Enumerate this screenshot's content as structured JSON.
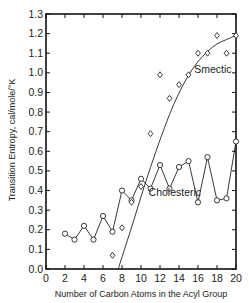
{
  "chart_data": {
    "type": "line",
    "title": "",
    "xlabel": "Number of Carbon Atoms in the Acyl Group",
    "ylabel": "Transition Entropy, cal/mole/°K",
    "xlim": [
      0,
      20
    ],
    "ylim": [
      0,
      1.3
    ],
    "x_ticks": [
      0,
      2,
      4,
      6,
      8,
      10,
      12,
      14,
      16,
      18,
      20
    ],
    "y_ticks": [
      "0.0",
      "0.1",
      "0.2",
      "0.3",
      "0.4",
      "0.5",
      "0.6",
      "0.7",
      "0.8",
      "0.9",
      "1.0",
      "1.1",
      "1.2",
      "1.3"
    ],
    "grid": false,
    "legend": "inline labels",
    "series": [
      {
        "name": "Cholesteric",
        "marker": "circle",
        "connected": true,
        "x": [
          2,
          3,
          4,
          5,
          6,
          7,
          8,
          9,
          10,
          11,
          12,
          13,
          14,
          15,
          16,
          17,
          18,
          19,
          20
        ],
        "values": [
          0.18,
          0.15,
          0.22,
          0.15,
          0.27,
          0.19,
          0.4,
          0.35,
          0.46,
          0.41,
          0.53,
          0.41,
          0.52,
          0.55,
          0.34,
          0.57,
          0.35,
          0.36,
          0.65
        ]
      },
      {
        "name": "Smectic",
        "marker": "diamond",
        "connected": false,
        "fit_curve": true,
        "x": [
          7,
          8,
          9,
          10,
          11,
          12,
          13,
          14,
          15,
          16,
          17,
          18,
          19,
          20
        ],
        "values": [
          0.07,
          0.21,
          0.34,
          0.42,
          0.69,
          0.99,
          0.87,
          0.94,
          0.99,
          1.1,
          1.1,
          1.19,
          1.1,
          1.19
        ],
        "fit": {
          "x": [
            7.6,
            9,
            10,
            11,
            12,
            13,
            14,
            15,
            16,
            17,
            18,
            19,
            20
          ],
          "values": [
            0.0,
            0.21,
            0.37,
            0.52,
            0.66,
            0.79,
            0.9,
            0.99,
            1.06,
            1.11,
            1.15,
            1.17,
            1.19
          ]
        }
      }
    ],
    "annotations": [
      {
        "text": "Smectic",
        "x": 15.6,
        "y": 1.0
      },
      {
        "text": "Cholesteric",
        "x": 10.8,
        "y": 0.37
      }
    ]
  }
}
